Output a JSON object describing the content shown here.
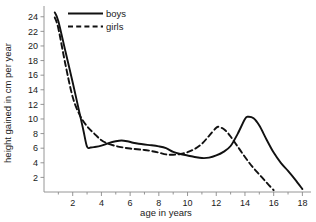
{
  "chart_data": {
    "type": "line",
    "title": "",
    "xlabel": "age in years",
    "ylabel": "height gained in cm per year",
    "xlim": [
      0,
      18.6
    ],
    "ylim": [
      0,
      25.2
    ],
    "grid": false,
    "legend_position": "top-center",
    "x_ticks": [
      2,
      4,
      6,
      8,
      10,
      12,
      14,
      16,
      18
    ],
    "x_tick_labels": [
      "2",
      "4",
      "6",
      "8",
      "10",
      "12",
      "14",
      "16",
      "18"
    ],
    "x_minor_ticks": [
      1,
      3,
      5,
      7,
      9,
      11,
      13,
      15,
      17
    ],
    "y_ticks": [
      2,
      4,
      6,
      8,
      10,
      12,
      14,
      16,
      18,
      20,
      22,
      24
    ],
    "y_tick_labels": [
      "2",
      "4",
      "6",
      "8",
      "10",
      "12",
      "14",
      "16",
      "18",
      "20",
      "22",
      "24"
    ],
    "series": [
      {
        "name": "boys",
        "style": "solid",
        "color": "#111111",
        "x": [
          0.75,
          1.0,
          1.5,
          2.0,
          2.5,
          2.75,
          3.0,
          3.25,
          3.5,
          4.0,
          4.5,
          5.0,
          5.4,
          5.8,
          6.2,
          6.6,
          7.0,
          7.5,
          8.0,
          8.5,
          9.0,
          9.5,
          10.0,
          10.5,
          11.0,
          11.5,
          12.0,
          12.5,
          13.0,
          13.5,
          14.0,
          14.2,
          14.6,
          15.0,
          15.5,
          16.0,
          16.5,
          17.0,
          17.5,
          18.0
        ],
        "y": [
          24.6,
          23.4,
          19.2,
          15.0,
          10.6,
          8.4,
          6.2,
          6.1,
          6.15,
          6.35,
          6.7,
          6.95,
          7.05,
          6.95,
          6.75,
          6.6,
          6.5,
          6.4,
          6.25,
          6.0,
          5.5,
          5.2,
          5.0,
          4.8,
          4.65,
          4.7,
          5.0,
          5.5,
          6.3,
          8.0,
          10.0,
          10.3,
          10.1,
          9.1,
          7.2,
          5.4,
          4.0,
          2.9,
          1.7,
          0.4
        ]
      },
      {
        "name": "girls",
        "style": "dashed",
        "color": "#111111",
        "x": [
          0.75,
          1.0,
          1.5,
          2.0,
          2.5,
          3.0,
          3.5,
          4.0,
          4.5,
          5.0,
          5.5,
          6.0,
          6.5,
          7.0,
          7.5,
          8.0,
          8.5,
          9.0,
          9.5,
          10.0,
          10.5,
          11.0,
          11.5,
          12.0,
          12.2,
          12.6,
          13.0,
          13.5,
          14.0,
          14.5,
          15.0,
          15.5,
          16.0
        ],
        "y": [
          23.9,
          22.4,
          17.4,
          13.0,
          10.5,
          9.0,
          8.0,
          7.1,
          6.6,
          6.3,
          6.1,
          5.95,
          5.85,
          5.75,
          5.6,
          5.4,
          5.15,
          5.1,
          5.2,
          5.45,
          5.9,
          6.6,
          7.7,
          8.8,
          8.9,
          8.5,
          7.6,
          6.2,
          4.8,
          3.5,
          2.4,
          1.3,
          0.25
        ]
      }
    ],
    "legend": [
      {
        "label": "boys",
        "style": "solid"
      },
      {
        "label": "girls",
        "style": "dashed"
      }
    ]
  }
}
